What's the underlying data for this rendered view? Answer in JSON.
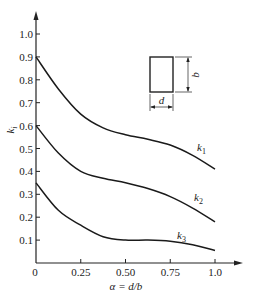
{
  "chart_data": {
    "type": "line",
    "title": "",
    "xlabel": "α = d/b",
    "ylabel": "k_i",
    "xlim": [
      0,
      1.0
    ],
    "ylim": [
      0,
      1.0
    ],
    "x_ticks": [
      "0",
      "0.25",
      "0.50",
      "0.75",
      "1.0"
    ],
    "y_ticks": [
      "0.1",
      "0.2",
      "0.3",
      "0.4",
      "0.5",
      "0.6",
      "0.7",
      "0.8",
      "0.9",
      "1.0"
    ],
    "grid": false,
    "legend": "inline labels near curve ends",
    "x": [
      0,
      0.125,
      0.25,
      0.375,
      0.5,
      0.625,
      0.75,
      0.875,
      1.0
    ],
    "series": [
      {
        "name": "k1",
        "label_main": "k",
        "label_sub": "1",
        "values": [
          0.9,
          0.76,
          0.65,
          0.59,
          0.56,
          0.54,
          0.515,
          0.47,
          0.41
        ]
      },
      {
        "name": "k2",
        "label_main": "k",
        "label_sub": "2",
        "values": [
          0.6,
          0.48,
          0.4,
          0.37,
          0.35,
          0.325,
          0.29,
          0.24,
          0.18
        ]
      },
      {
        "name": "k3",
        "label_main": "k",
        "label_sub": "3",
        "values": [
          0.35,
          0.23,
          0.165,
          0.115,
          0.1,
          0.1,
          0.095,
          0.08,
          0.055
        ]
      }
    ],
    "inset": {
      "description": "rectangular cross-section with width d and height b",
      "width_label": "d",
      "height_label": "b"
    }
  }
}
